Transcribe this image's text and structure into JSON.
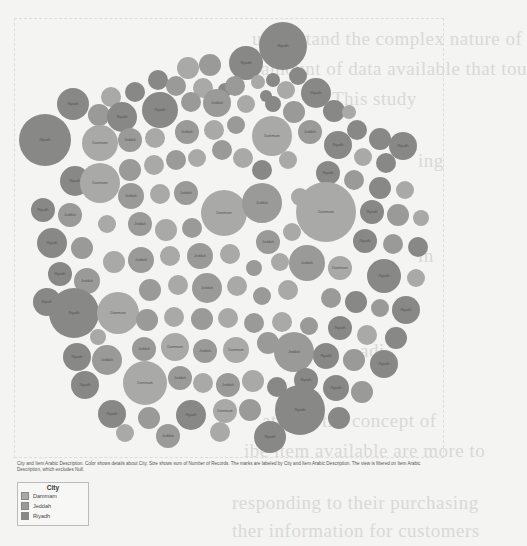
{
  "page": {
    "background": "#f4f4f2",
    "bleed_text_lines": [
      "understand the complex nature of",
      "t amount of data available that tou",
      "This study",
      "ing",
      "in",
      "adi",
      "ated to the concept of",
      "ibe item available are more to",
      "responding to their purchasing",
      "ther information for customers"
    ]
  },
  "legend": {
    "title": "City",
    "items": [
      {
        "label": "Dammam",
        "color": "#a9a9a7"
      },
      {
        "label": "Jeddah",
        "color": "#9a9a98"
      },
      {
        "label": "Riyadh",
        "color": "#888886"
      }
    ]
  },
  "caption": "City and Item Arabic Description.  Color shows details about City.  Size shows sum of Number of Records.  The marks are labeled by City and Item Arabic Description. The view is filtered on Item Arabic Description, which excludes Null.",
  "chart_data": {
    "type": "packed-bubble",
    "title": "",
    "dimensions": [
      "City",
      "Item Arabic Description"
    ],
    "color_by": "City",
    "size_by": "Sum of Number of Records",
    "label_by": [
      "City",
      "Item Arabic Description"
    ],
    "filter": "Item Arabic Description excludes Null",
    "legend_position": "bottom-left",
    "series": [
      {
        "name": "Dammam",
        "color": "#a9a9a7"
      },
      {
        "name": "Jeddah",
        "color": "#9a9a98"
      },
      {
        "name": "Riyadh",
        "color": "#888886"
      }
    ],
    "bubbles": [
      [
        283,
        46,
        24,
        "Riyadh"
      ],
      [
        246,
        63,
        17,
        "Riyadh"
      ],
      [
        210,
        65,
        11,
        "Jeddah"
      ],
      [
        188,
        68,
        11,
        "Dammam"
      ],
      [
        298,
        76,
        9,
        "Riyadh"
      ],
      [
        158,
        80,
        10,
        "Riyadh"
      ],
      [
        176,
        86,
        10,
        "Jeddah"
      ],
      [
        203,
        88,
        10,
        "Dammam"
      ],
      [
        225,
        90,
        7,
        "Riyadh"
      ],
      [
        235,
        86,
        10,
        "Jeddah"
      ],
      [
        258,
        82,
        7,
        "Dammam"
      ],
      [
        273,
        80,
        7,
        "Riyadh"
      ],
      [
        316,
        93,
        15,
        "Riyadh"
      ],
      [
        286,
        90,
        9,
        "Dammam"
      ],
      [
        266,
        96,
        6,
        "Riyadh"
      ],
      [
        135,
        92,
        10,
        "Riyadh"
      ],
      [
        111,
        97,
        10,
        "Dammam"
      ],
      [
        73,
        104,
        16,
        "Riyadh"
      ],
      [
        99,
        115,
        11,
        "Jeddah"
      ],
      [
        122,
        117,
        15,
        "Riyadh"
      ],
      [
        160,
        110,
        18,
        "Riyadh"
      ],
      [
        191,
        102,
        10,
        "Jeddah"
      ],
      [
        217,
        103,
        14,
        "Jeddah"
      ],
      [
        246,
        104,
        9,
        "Dammam"
      ],
      [
        273,
        104,
        8,
        "Riyadh"
      ],
      [
        294,
        112,
        11,
        "Jeddah"
      ],
      [
        334,
        111,
        11,
        "Riyadh"
      ],
      [
        349,
        112,
        7,
        "Dammam"
      ],
      [
        357,
        130,
        10,
        "Riyadh"
      ],
      [
        380,
        139,
        11,
        "Riyadh"
      ],
      [
        403,
        146,
        14,
        "Riyadh"
      ],
      [
        45,
        140,
        26,
        "Riyadh"
      ],
      [
        100,
        143,
        18,
        "Dammam"
      ],
      [
        130,
        140,
        12,
        "Jeddah"
      ],
      [
        155,
        138,
        10,
        "Dammam"
      ],
      [
        187,
        132,
        12,
        "Jeddah"
      ],
      [
        214,
        130,
        10,
        "Dammam"
      ],
      [
        236,
        125,
        9,
        "Jeddah"
      ],
      [
        272,
        136,
        20,
        "Dammam"
      ],
      [
        310,
        132,
        12,
        "Jeddah"
      ],
      [
        338,
        145,
        14,
        "Riyadh"
      ],
      [
        363,
        157,
        9,
        "Dammam"
      ],
      [
        386,
        163,
        10,
        "Riyadh"
      ],
      [
        75,
        181,
        15,
        "Riyadh"
      ],
      [
        100,
        183,
        20,
        "Dammam"
      ],
      [
        130,
        170,
        11,
        "Jeddah"
      ],
      [
        154,
        165,
        10,
        "Dammam"
      ],
      [
        176,
        160,
        10,
        "Jeddah"
      ],
      [
        197,
        158,
        9,
        "Dammam"
      ],
      [
        222,
        150,
        10,
        "Jeddah"
      ],
      [
        243,
        158,
        10,
        "Dammam"
      ],
      [
        262,
        170,
        10,
        "Riyadh"
      ],
      [
        288,
        160,
        9,
        "Dammam"
      ],
      [
        328,
        173,
        12,
        "Riyadh"
      ],
      [
        354,
        180,
        10,
        "Jeddah"
      ],
      [
        380,
        188,
        11,
        "Riyadh"
      ],
      [
        405,
        190,
        9,
        "Dammam"
      ],
      [
        43,
        210,
        12,
        "Riyadh"
      ],
      [
        70,
        215,
        12,
        "Jeddah"
      ],
      [
        131,
        196,
        13,
        "Jeddah"
      ],
      [
        160,
        194,
        10,
        "Dammam"
      ],
      [
        186,
        193,
        12,
        "Jeddah"
      ],
      [
        224,
        213,
        23,
        "Dammam"
      ],
      [
        262,
        203,
        20,
        "Jeddah"
      ],
      [
        300,
        197,
        9,
        "Dammam"
      ],
      [
        326,
        212,
        30,
        "Dammam"
      ],
      [
        372,
        212,
        12,
        "Riyadh"
      ],
      [
        398,
        215,
        11,
        "Jeddah"
      ],
      [
        421,
        218,
        8,
        "Dammam"
      ],
      [
        52,
        243,
        15,
        "Riyadh"
      ],
      [
        82,
        248,
        11,
        "Jeddah"
      ],
      [
        107,
        224,
        9,
        "Dammam"
      ],
      [
        140,
        224,
        12,
        "Jeddah"
      ],
      [
        166,
        230,
        11,
        "Dammam"
      ],
      [
        192,
        228,
        10,
        "Jeddah"
      ],
      [
        268,
        242,
        12,
        "Jeddah"
      ],
      [
        292,
        232,
        9,
        "Dammam"
      ],
      [
        365,
        241,
        12,
        "Riyadh"
      ],
      [
        393,
        244,
        10,
        "Jeddah"
      ],
      [
        418,
        247,
        10,
        "Riyadh"
      ],
      [
        60,
        274,
        12,
        "Riyadh"
      ],
      [
        87,
        281,
        13,
        "Jeddah"
      ],
      [
        114,
        262,
        11,
        "Dammam"
      ],
      [
        141,
        260,
        13,
        "Jeddah"
      ],
      [
        170,
        256,
        10,
        "Dammam"
      ],
      [
        200,
        256,
        13,
        "Jeddah"
      ],
      [
        230,
        254,
        10,
        "Dammam"
      ],
      [
        254,
        268,
        8,
        "Jeddah"
      ],
      [
        280,
        262,
        9,
        "Dammam"
      ],
      [
        307,
        263,
        18,
        "Jeddah"
      ],
      [
        340,
        268,
        12,
        "Dammam"
      ],
      [
        384,
        276,
        17,
        "Riyadh"
      ],
      [
        416,
        278,
        9,
        "Dammam"
      ],
      [
        47,
        302,
        14,
        "Riyadh"
      ],
      [
        74,
        313,
        25,
        "Riyadh"
      ],
      [
        118,
        313,
        21,
        "Dammam"
      ],
      [
        150,
        290,
        11,
        "Jeddah"
      ],
      [
        178,
        285,
        10,
        "Dammam"
      ],
      [
        207,
        288,
        15,
        "Jeddah"
      ],
      [
        237,
        286,
        10,
        "Dammam"
      ],
      [
        262,
        296,
        9,
        "Jeddah"
      ],
      [
        288,
        290,
        10,
        "Dammam"
      ],
      [
        331,
        298,
        10,
        "Jeddah"
      ],
      [
        356,
        302,
        11,
        "Riyadh"
      ],
      [
        380,
        308,
        9,
        "Jeddah"
      ],
      [
        406,
        310,
        14,
        "Riyadh"
      ],
      [
        98,
        337,
        8,
        "Dammam"
      ],
      [
        147,
        320,
        11,
        "Jeddah"
      ],
      [
        174,
        317,
        10,
        "Dammam"
      ],
      [
        202,
        319,
        11,
        "Jeddah"
      ],
      [
        228,
        318,
        10,
        "Dammam"
      ],
      [
        254,
        323,
        10,
        "Jeddah"
      ],
      [
        282,
        322,
        10,
        "Dammam"
      ],
      [
        309,
        326,
        9,
        "Jeddah"
      ],
      [
        340,
        328,
        12,
        "Riyadh"
      ],
      [
        367,
        335,
        10,
        "Dammam"
      ],
      [
        396,
        338,
        11,
        "Riyadh"
      ],
      [
        77,
        357,
        14,
        "Riyadh"
      ],
      [
        107,
        360,
        15,
        "Jeddah"
      ],
      [
        144,
        349,
        12,
        "Jeddah"
      ],
      [
        175,
        347,
        14,
        "Dammam"
      ],
      [
        205,
        351,
        12,
        "Jeddah"
      ],
      [
        236,
        350,
        13,
        "Dammam"
      ],
      [
        268,
        343,
        11,
        "Jeddah"
      ],
      [
        294,
        352,
        20,
        "Jeddah"
      ],
      [
        326,
        356,
        13,
        "Riyadh"
      ],
      [
        354,
        360,
        11,
        "Jeddah"
      ],
      [
        384,
        364,
        14,
        "Riyadh"
      ],
      [
        85,
        385,
        14,
        "Riyadh"
      ],
      [
        145,
        383,
        22,
        "Dammam"
      ],
      [
        180,
        378,
        12,
        "Jeddah"
      ],
      [
        203,
        383,
        10,
        "Dammam"
      ],
      [
        228,
        385,
        12,
        "Jeddah"
      ],
      [
        253,
        381,
        11,
        "Dammam"
      ],
      [
        277,
        387,
        10,
        "Riyadh"
      ],
      [
        306,
        380,
        12,
        "Riyadh"
      ],
      [
        336,
        388,
        13,
        "Riyadh"
      ],
      [
        362,
        392,
        11,
        "Jeddah"
      ],
      [
        112,
        414,
        14,
        "Riyadh"
      ],
      [
        149,
        418,
        11,
        "Jeddah"
      ],
      [
        191,
        415,
        15,
        "Riyadh"
      ],
      [
        225,
        411,
        12,
        "Dammam"
      ],
      [
        250,
        410,
        11,
        "Jeddah"
      ],
      [
        300,
        410,
        25,
        "Riyadh"
      ],
      [
        339,
        418,
        11,
        "Riyadh"
      ],
      [
        270,
        437,
        16,
        "Riyadh"
      ],
      [
        220,
        432,
        10,
        "Dammam"
      ],
      [
        168,
        436,
        12,
        "Jeddah"
      ],
      [
        125,
        433,
        9,
        "Dammam"
      ]
    ]
  }
}
